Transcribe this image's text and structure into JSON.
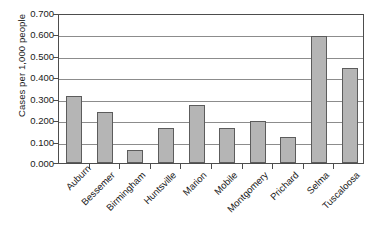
{
  "chart_data": {
    "type": "bar",
    "title": "",
    "xlabel": "",
    "ylabel": "Cases per 1,000 people",
    "ylim": [
      0.0,
      0.7
    ],
    "ytick_labels": [
      "0.700",
      "0.600",
      "0.500",
      "0.400",
      "0.300",
      "0.200",
      "0.100",
      "0.000"
    ],
    "ytick_values": [
      0.7,
      0.6,
      0.5,
      0.4,
      0.3,
      0.2,
      0.1,
      0.0
    ],
    "grid": "horizontal",
    "legend": "none",
    "bar_color": "#b5b5b5",
    "bar_border_color": "#5c5c5c",
    "categories": [
      "Auburn",
      "Bessemer",
      "Birmingham",
      "Huntsville",
      "Marion",
      "Mobile",
      "Montgomery",
      "Prichard",
      "Selma",
      "Tuscaloosa"
    ],
    "values": [
      0.312,
      0.238,
      0.063,
      0.163,
      0.273,
      0.165,
      0.196,
      0.12,
      0.592,
      0.443
    ]
  }
}
